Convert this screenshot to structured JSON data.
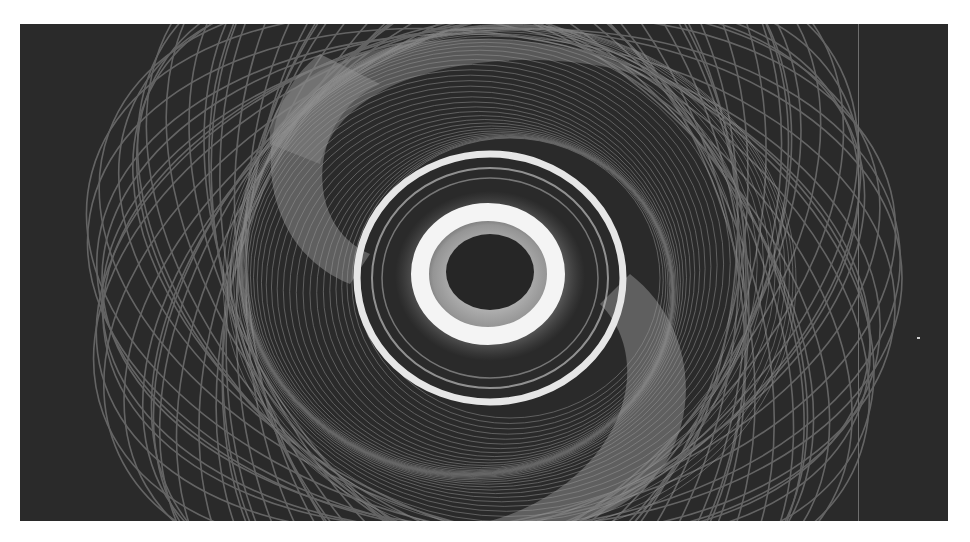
{
  "image": {
    "description": "Grayscale long-exposure light-painting photograph of a spirograph-like spiral vortex with a dark elliptical core",
    "palette": {
      "background": "#2a2a2a",
      "outer_lines": "#7a7a7a",
      "gray_band": "#8a8a8a",
      "inner_ring": "#e8e8e8",
      "glow": "#f5f5f5",
      "core": "#262626",
      "page": "#ffffff"
    }
  }
}
